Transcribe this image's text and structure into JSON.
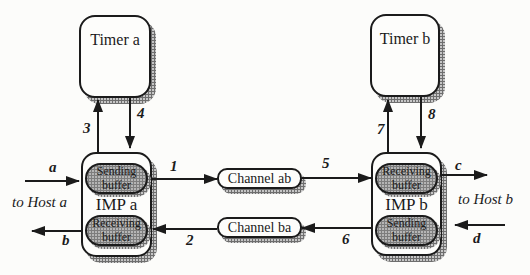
{
  "colors": {
    "line": "#1b1b1b",
    "box-fill": "#fdfdfb",
    "buffer-fill": "#b5b5b5",
    "buffer-dot": "#7d7d7d",
    "shadow-base": "#c6c6c6",
    "shadow-dot": "#6e6e6e",
    "background": "#fcfcfa",
    "text": "#1a1a1a"
  },
  "nodes": {
    "timer_a": {
      "label": "Timer a"
    },
    "timer_b": {
      "label": "Timer b"
    },
    "imp_a": {
      "label": "IMP a",
      "top_buffer": "Sending buffer",
      "bottom_buffer": "Receiving buffer"
    },
    "imp_b": {
      "label": "IMP b",
      "top_buffer": "Receiving buffer",
      "bottom_buffer": "Sending buffer"
    },
    "channel_ab": {
      "label": "Channel ab"
    },
    "channel_ba": {
      "label": "Channel ba"
    }
  },
  "edge_labels": {
    "n1": "1",
    "n2": "2",
    "n3": "3",
    "n4": "4",
    "n5": "5",
    "n6": "6",
    "n7": "7",
    "n8": "8",
    "a": "a",
    "b": "b",
    "c": "c",
    "d": "d"
  },
  "annotations": {
    "to_host_a": "to Host a",
    "to_host_b": "to Host b"
  }
}
